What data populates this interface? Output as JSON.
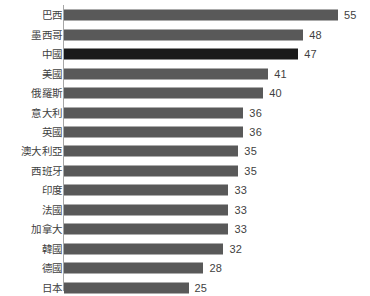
{
  "chart_data": {
    "type": "bar",
    "orientation": "horizontal",
    "title": "",
    "subtitle": "",
    "xlabel": "",
    "ylabel": "",
    "xlim": [
      0,
      55
    ],
    "grid": false,
    "legend": null,
    "axis_line": true,
    "categories": [
      "巴西",
      "墨西哥",
      "中國",
      "美國",
      "俄羅斯",
      "意大利",
      "英國",
      "澳大利亞",
      "西班牙",
      "印度",
      "法國",
      "加拿大",
      "韓國",
      "德國",
      "日本"
    ],
    "values": [
      55,
      48,
      47,
      41,
      40,
      36,
      36,
      35,
      35,
      33,
      33,
      33,
      32,
      28,
      25
    ],
    "highlight_index": 2,
    "colors": {
      "bar": "#595959",
      "bar_highlight": "#1a1a1a",
      "axis": "#a6a6a6",
      "text": "#3f3f3f",
      "background": "#ffffff"
    },
    "bars": [
      {
        "label": "巴西",
        "value": 55,
        "value_text": "55",
        "highlight": false
      },
      {
        "label": "墨西哥",
        "value": 48,
        "value_text": "48",
        "highlight": false
      },
      {
        "label": "中國",
        "value": 47,
        "value_text": "47",
        "highlight": true
      },
      {
        "label": "美國",
        "value": 41,
        "value_text": "41",
        "highlight": false
      },
      {
        "label": "俄羅斯",
        "value": 40,
        "value_text": "40",
        "highlight": false
      },
      {
        "label": "意大利",
        "value": 36,
        "value_text": "36",
        "highlight": false
      },
      {
        "label": "英國",
        "value": 36,
        "value_text": "36",
        "highlight": false
      },
      {
        "label": "澳大利亞",
        "value": 35,
        "value_text": "35",
        "highlight": false
      },
      {
        "label": "西班牙",
        "value": 35,
        "value_text": "35",
        "highlight": false
      },
      {
        "label": "印度",
        "value": 33,
        "value_text": "33",
        "highlight": false
      },
      {
        "label": "法國",
        "value": 33,
        "value_text": "33",
        "highlight": false
      },
      {
        "label": "加拿大",
        "value": 33,
        "value_text": "33",
        "highlight": false
      },
      {
        "label": "韓國",
        "value": 32,
        "value_text": "32",
        "highlight": false
      },
      {
        "label": "德國",
        "value": 28,
        "value_text": "28",
        "highlight": false
      },
      {
        "label": "日本",
        "value": 25,
        "value_text": "25",
        "highlight": false
      }
    ]
  }
}
